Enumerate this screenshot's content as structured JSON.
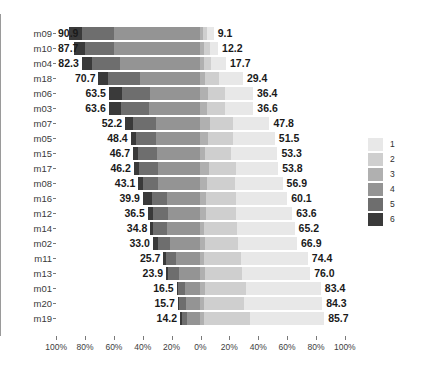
{
  "chart_data": {
    "type": "bar",
    "subtype": "diverging-stacked-bar",
    "title": "",
    "subtitle": "",
    "xlabel": "",
    "ylabel": "",
    "grid": false,
    "legend_position": "right",
    "legend_title": "",
    "x_tick_labels": [
      "100%",
      "80%",
      "60%",
      "40%",
      "20%",
      "0%",
      "20%",
      "40%",
      "60%",
      "80%",
      "100%"
    ],
    "x_tick_positions": [
      -100,
      -80,
      -60,
      -40,
      -20,
      0,
      20,
      40,
      60,
      80,
      100
    ],
    "xlim": [
      -100,
      100
    ],
    "legend_entries": [
      "1",
      "2",
      "3",
      "4",
      "5",
      "6"
    ],
    "series_colors": [
      "#e8e8e8",
      "#cfcfcf",
      "#b0b0b0",
      "#949494",
      "#6e6e6e",
      "#3a3a3a"
    ],
    "categories": [
      "m09",
      "m10",
      "m04",
      "m18",
      "m06",
      "m03",
      "m07",
      "m05",
      "m15",
      "m17",
      "m08",
      "m16",
      "m12",
      "m14",
      "m02",
      "m11",
      "m13",
      "m01",
      "m20",
      "m19"
    ],
    "left_totals": [
      90.9,
      87.7,
      82.3,
      70.7,
      63.5,
      63.6,
      52.2,
      48.4,
      46.7,
      46.2,
      43.1,
      39.9,
      36.5,
      34.8,
      33.0,
      25.7,
      23.9,
      16.5,
      15.7,
      14.2
    ],
    "right_totals": [
      9.1,
      12.2,
      17.7,
      29.4,
      36.4,
      36.6,
      47.8,
      51.5,
      53.3,
      53.8,
      56.9,
      60.1,
      63.6,
      65.2,
      66.9,
      74.4,
      76.0,
      83.4,
      84.3,
      85.7
    ],
    "rows": [
      {
        "label": "m09",
        "left_total": 90.9,
        "right_total": 9.1,
        "segments": [
          47.8,
          28.6,
          14.5,
          6.0,
          2.2,
          0.9
        ]
      },
      {
        "label": "m10",
        "left_total": 87.7,
        "right_total": 12.2,
        "segments": [
          40.7,
          30.3,
          16.7,
          8.4,
          2.8,
          1.1
        ]
      },
      {
        "label": "m04",
        "left_total": 82.3,
        "right_total": 17.7,
        "segments": [
          47.2,
          25.3,
          9.8,
          12.0,
          4.1,
          1.6
        ]
      },
      {
        "label": "m18",
        "left_total": 70.7,
        "right_total": 29.4,
        "segments": [
          40.1,
          22.6,
          8.0,
          17.5,
          9.1,
          2.7
        ]
      },
      {
        "label": "m06",
        "left_total": 63.5,
        "right_total": 36.4,
        "segments": [
          33.3,
          20.6,
          9.6,
          20.1,
          11.0,
          5.3
        ]
      },
      {
        "label": "m03",
        "left_total": 63.6,
        "right_total": 36.6,
        "segments": [
          34.1,
          21.2,
          8.3,
          20.4,
          11.1,
          4.9
        ]
      },
      {
        "label": "m07",
        "left_total": 52.2,
        "right_total": 47.8,
        "segments": [
          31.5,
          20.1,
          7.8,
          23.9,
          12.6,
          4.1
        ]
      },
      {
        "label": "m05",
        "left_total": 48.4,
        "right_total": 51.5,
        "segments": [
          33.8,
          20.5,
          5.9,
          25.1,
          11.7,
          3.0
        ]
      },
      {
        "label": "m15",
        "left_total": 46.7,
        "right_total": 53.3,
        "segments": [
          35.6,
          20.2,
          3.6,
          26.0,
          11.5,
          3.1
        ]
      },
      {
        "label": "m17",
        "left_total": 46.2,
        "right_total": 53.8,
        "segments": [
          33.2,
          21.4,
          6.9,
          24.7,
          10.9,
          2.9
        ]
      },
      {
        "label": "m08",
        "left_total": 43.1,
        "right_total": 56.9,
        "segments": [
          36.9,
          21.3,
          5.0,
          24.9,
          9.3,
          2.6
        ]
      },
      {
        "label": "m16",
        "left_total": 39.9,
        "right_total": 60.1,
        "segments": [
          37.3,
          22.0,
          4.1,
          21.3,
          9.8,
          5.5
        ]
      },
      {
        "label": "m12",
        "left_total": 36.5,
        "right_total": 63.6,
        "segments": [
          40.2,
          21.4,
          3.9,
          21.4,
          9.8,
          3.3
        ]
      },
      {
        "label": "m14",
        "left_total": 34.8,
        "right_total": 65.2,
        "segments": [
          41.1,
          23.0,
          2.5,
          22.6,
          9.0,
          1.8
        ]
      },
      {
        "label": "m02",
        "left_total": 33.0,
        "right_total": 66.9,
        "segments": [
          42.0,
          23.7,
          3.5,
          19.5,
          8.3,
          3.0
        ]
      },
      {
        "label": "m11",
        "left_total": 25.7,
        "right_total": 74.4,
        "segments": [
          47.3,
          26.0,
          2.8,
          15.9,
          6.6,
          1.4
        ]
      },
      {
        "label": "m13",
        "left_total": 23.9,
        "right_total": 76.0,
        "segments": [
          48.5,
          26.5,
          2.9,
          14.0,
          6.7,
          1.4
        ]
      },
      {
        "label": "m01",
        "left_total": 16.5,
        "right_total": 83.4,
        "segments": [
          53.3,
          28.9,
          3.0,
          9.6,
          4.1,
          1.1
        ]
      },
      {
        "label": "m20",
        "left_total": 15.7,
        "right_total": 84.3,
        "segments": [
          54.9,
          28.2,
          2.8,
          9.3,
          3.8,
          1.0
        ]
      },
      {
        "label": "m19",
        "left_total": 14.2,
        "right_total": 85.7,
        "segments": [
          52.0,
          32.2,
          2.8,
          8.3,
          3.3,
          1.4
        ]
      }
    ]
  }
}
